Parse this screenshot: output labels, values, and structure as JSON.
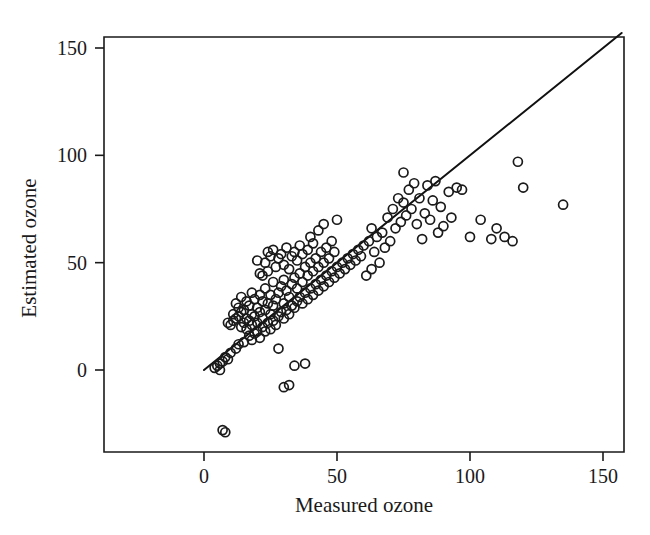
{
  "figure": {
    "background_color": "#ffffff",
    "ink_color": "#1a1a1a",
    "xlabel": "Measured ozone",
    "ylabel": "Estimated ozone"
  },
  "chart_data": {
    "type": "scatter",
    "title": "",
    "xlabel": "Measured ozone",
    "ylabel": "Estimated ozone",
    "xlim": [
      -27,
      170
    ],
    "ylim": [
      -42,
      161
    ],
    "xticks": [
      0,
      50,
      100,
      150
    ],
    "yticks": [
      0,
      50,
      100,
      150
    ],
    "xtick_labels": [
      "0",
      "50",
      "100",
      "150"
    ],
    "ytick_labels": [
      "0",
      "50",
      "100",
      "150"
    ],
    "grid": false,
    "legend": null,
    "marker": "open-circle",
    "marker_size_px": 9,
    "annotations": [
      {
        "name": "identity-reference-line",
        "type": "line",
        "description": "1:1 y = x reference line drawn from origin to upper-right corner",
        "x": [
          0,
          157
        ],
        "y": [
          0,
          157
        ]
      }
    ],
    "series": [
      {
        "name": "Ozone estimates",
        "points": [
          [
            4,
            1
          ],
          [
            5,
            2
          ],
          [
            6,
            3
          ],
          [
            6,
            0
          ],
          [
            7,
            4
          ],
          [
            7,
            -28
          ],
          [
            8,
            -29
          ],
          [
            8,
            6
          ],
          [
            9,
            5
          ],
          [
            9,
            22
          ],
          [
            10,
            8
          ],
          [
            10,
            21
          ],
          [
            11,
            23
          ],
          [
            11,
            26
          ],
          [
            12,
            10
          ],
          [
            12,
            24
          ],
          [
            12,
            31
          ],
          [
            13,
            12
          ],
          [
            13,
            25
          ],
          [
            13,
            29
          ],
          [
            14,
            20
          ],
          [
            14,
            27
          ],
          [
            14,
            34
          ],
          [
            15,
            13
          ],
          [
            15,
            22
          ],
          [
            15,
            28
          ],
          [
            16,
            19
          ],
          [
            16,
            24
          ],
          [
            16,
            32
          ],
          [
            17,
            16
          ],
          [
            17,
            23
          ],
          [
            17,
            30
          ],
          [
            18,
            14
          ],
          [
            18,
            21
          ],
          [
            18,
            26
          ],
          [
            18,
            36
          ],
          [
            19,
            17
          ],
          [
            19,
            25
          ],
          [
            19,
            33
          ],
          [
            20,
            18
          ],
          [
            20,
            22
          ],
          [
            20,
            29
          ],
          [
            20,
            51
          ],
          [
            21,
            15
          ],
          [
            21,
            27
          ],
          [
            21,
            35
          ],
          [
            21,
            45
          ],
          [
            22,
            20
          ],
          [
            22,
            24
          ],
          [
            22,
            32
          ],
          [
            22,
            44
          ],
          [
            23,
            18
          ],
          [
            23,
            28
          ],
          [
            23,
            38
          ],
          [
            23,
            50
          ],
          [
            24,
            22
          ],
          [
            24,
            31
          ],
          [
            24,
            46
          ],
          [
            24,
            55
          ],
          [
            25,
            19
          ],
          [
            25,
            26
          ],
          [
            25,
            35
          ],
          [
            25,
            53
          ],
          [
            26,
            23
          ],
          [
            26,
            30
          ],
          [
            26,
            41
          ],
          [
            26,
            56
          ],
          [
            27,
            21
          ],
          [
            27,
            33
          ],
          [
            27,
            48
          ],
          [
            28,
            25
          ],
          [
            28,
            36
          ],
          [
            28,
            52
          ],
          [
            28,
            10
          ],
          [
            29,
            27
          ],
          [
            29,
            39
          ],
          [
            29,
            54
          ],
          [
            30,
            24
          ],
          [
            30,
            31
          ],
          [
            30,
            42
          ],
          [
            30,
            49
          ],
          [
            30,
            -8
          ],
          [
            31,
            28
          ],
          [
            31,
            37
          ],
          [
            31,
            57
          ],
          [
            32,
            26
          ],
          [
            32,
            34
          ],
          [
            32,
            47
          ],
          [
            32,
            -7
          ],
          [
            33,
            30
          ],
          [
            33,
            40
          ],
          [
            33,
            53
          ],
          [
            34,
            29
          ],
          [
            34,
            43
          ],
          [
            34,
            55
          ],
          [
            34,
            2
          ],
          [
            35,
            32
          ],
          [
            35,
            38
          ],
          [
            35,
            51
          ],
          [
            36,
            34
          ],
          [
            36,
            45
          ],
          [
            36,
            58
          ],
          [
            37,
            31
          ],
          [
            37,
            41
          ],
          [
            37,
            54
          ],
          [
            38,
            36
          ],
          [
            38,
            48
          ],
          [
            38,
            3
          ],
          [
            39,
            33
          ],
          [
            39,
            44
          ],
          [
            39,
            56
          ],
          [
            40,
            38
          ],
          [
            40,
            50
          ],
          [
            40,
            62
          ],
          [
            41,
            35
          ],
          [
            41,
            46
          ],
          [
            41,
            59
          ],
          [
            42,
            40
          ],
          [
            42,
            52
          ],
          [
            43,
            37
          ],
          [
            43,
            48
          ],
          [
            43,
            65
          ],
          [
            44,
            42
          ],
          [
            44,
            55
          ],
          [
            45,
            39
          ],
          [
            45,
            50
          ],
          [
            45,
            68
          ],
          [
            46,
            44
          ],
          [
            46,
            57
          ],
          [
            47,
            41
          ],
          [
            47,
            52
          ],
          [
            48,
            46
          ],
          [
            48,
            60
          ],
          [
            49,
            43
          ],
          [
            49,
            55
          ],
          [
            50,
            48
          ],
          [
            50,
            70
          ],
          [
            51,
            45
          ],
          [
            52,
            50
          ],
          [
            53,
            47
          ],
          [
            54,
            52
          ],
          [
            55,
            49
          ],
          [
            56,
            54
          ],
          [
            57,
            51
          ],
          [
            58,
            56
          ],
          [
            59,
            53
          ],
          [
            60,
            58
          ],
          [
            61,
            44
          ],
          [
            62,
            60
          ],
          [
            63,
            47
          ],
          [
            63,
            66
          ],
          [
            64,
            55
          ],
          [
            65,
            62
          ],
          [
            66,
            50
          ],
          [
            67,
            64
          ],
          [
            68,
            57
          ],
          [
            69,
            71
          ],
          [
            70,
            60
          ],
          [
            71,
            75
          ],
          [
            72,
            66
          ],
          [
            73,
            80
          ],
          [
            74,
            69
          ],
          [
            75,
            92
          ],
          [
            75,
            78
          ],
          [
            76,
            72
          ],
          [
            77,
            84
          ],
          [
            78,
            75
          ],
          [
            79,
            87
          ],
          [
            80,
            68
          ],
          [
            81,
            80
          ],
          [
            82,
            61
          ],
          [
            83,
            73
          ],
          [
            84,
            86
          ],
          [
            85,
            70
          ],
          [
            86,
            79
          ],
          [
            87,
            88
          ],
          [
            88,
            64
          ],
          [
            89,
            76
          ],
          [
            90,
            67
          ],
          [
            92,
            83
          ],
          [
            93,
            71
          ],
          [
            95,
            85
          ],
          [
            97,
            84
          ],
          [
            100,
            62
          ],
          [
            104,
            70
          ],
          [
            108,
            61
          ],
          [
            110,
            66
          ],
          [
            113,
            62
          ],
          [
            116,
            60
          ],
          [
            118,
            97
          ],
          [
            120,
            85
          ],
          [
            135,
            77
          ]
        ]
      }
    ]
  }
}
